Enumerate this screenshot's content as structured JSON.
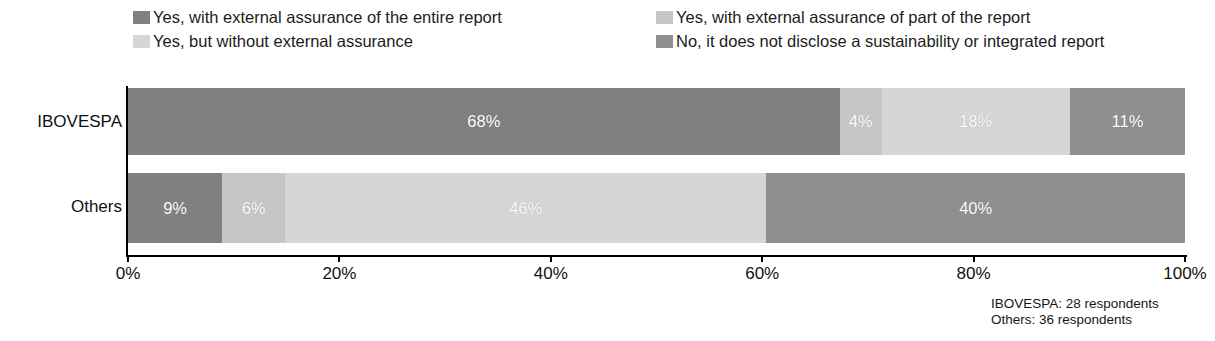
{
  "chart_data": {
    "type": "bar",
    "orientation": "horizontal",
    "stacked": true,
    "stack_mode": "percent",
    "title": "",
    "subtitle": "",
    "xlabel": "",
    "ylabel": "",
    "categories": [
      "IBOVESPA",
      "Others"
    ],
    "xlim": [
      0,
      100
    ],
    "xticks": [
      "0%",
      "20%",
      "40%",
      "60%",
      "80%",
      "100%"
    ],
    "xtick_values": [
      0,
      20,
      40,
      60,
      80,
      100
    ],
    "grid": false,
    "legend_position": "top",
    "series": [
      {
        "name": "Yes, with external assurance of the entire report",
        "color": "#808080",
        "values": [
          68,
          9
        ],
        "labels": [
          "68%",
          "9%"
        ]
      },
      {
        "name": "Yes, with external assurance of part of the report",
        "color": "#c6c6c6",
        "values": [
          4,
          6
        ],
        "labels": [
          "4%",
          "6%"
        ]
      },
      {
        "name": "Yes, but without external assurance",
        "color": "#d6d6d6",
        "values": [
          18,
          46
        ],
        "labels": [
          "18%",
          "46%"
        ]
      },
      {
        "name": "No, it does not disclose a sustainability or integrated report",
        "color": "#8f8f8f",
        "values": [
          11,
          40
        ],
        "labels": [
          "11%",
          "40%"
        ]
      }
    ],
    "annotations": [
      "IBOVESPA: 28 respondents",
      "Others: 36 respondents"
    ]
  },
  "legend": {
    "items": [
      {
        "label": "Yes, with external assurance of the entire report",
        "color": "#808080"
      },
      {
        "label": "Yes, with external assurance of part of the report",
        "color": "#c6c6c6"
      },
      {
        "label": "Yes, but without external assurance",
        "color": "#d6d6d6"
      },
      {
        "label": "No, it does not disclose a sustainability or integrated report",
        "color": "#8f8f8f"
      }
    ]
  },
  "axis": {
    "category_labels": [
      "IBOVESPA",
      "Others"
    ],
    "tick_labels": [
      "0%",
      "20%",
      "40%",
      "60%",
      "80%",
      "100%"
    ]
  },
  "footnotes": {
    "line1": "IBOVESPA: 28 respondents",
    "line2": "Others: 36 respondents"
  }
}
